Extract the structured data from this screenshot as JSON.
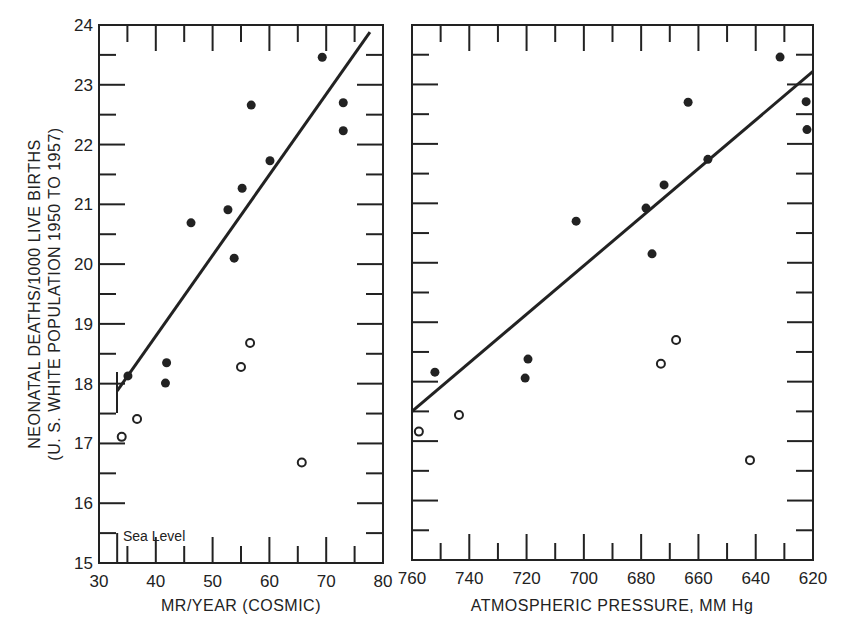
{
  "chart_data": [
    {
      "type": "scatter",
      "title": "",
      "xlabel": "MR/YEAR (COSMIC)",
      "ylabel": "NEONATAL DEATHS/1000 LIVE BIRTHS",
      "ylabel2": "(U. S. WHITE POPULATION 1950 TO 1957)",
      "xlim": [
        30,
        80
      ],
      "ylim": [
        15,
        24
      ],
      "xticks": [
        30,
        40,
        50,
        60,
        70,
        80
      ],
      "yticks": [
        15,
        16,
        17,
        18,
        19,
        20,
        21,
        22,
        23,
        24
      ],
      "grid": false,
      "annotations": [
        {
          "text": "Sea Level",
          "x": 34,
          "y": 15.4
        }
      ],
      "series": [
        {
          "name": "filled",
          "marker": "filled-circle",
          "points": [
            [
              69.3,
              23.46
            ],
            [
              56.8,
              22.66
            ],
            [
              73.0,
              22.7
            ],
            [
              73.0,
              22.23
            ],
            [
              60.1,
              21.73
            ],
            [
              55.2,
              21.27
            ],
            [
              52.7,
              20.91
            ],
            [
              46.2,
              20.69
            ],
            [
              53.8,
              20.1
            ],
            [
              35.1,
              18.13
            ],
            [
              41.9,
              18.35
            ],
            [
              41.7,
              18.01
            ]
          ]
        },
        {
          "name": "open",
          "marker": "open-circle",
          "points": [
            [
              34.0,
              17.11
            ],
            [
              36.7,
              17.41
            ],
            [
              55.0,
              18.28
            ],
            [
              56.6,
              18.68
            ],
            [
              65.7,
              16.68
            ]
          ]
        },
        {
          "name": "regression line",
          "type": "line",
          "points": [
            [
              33.2,
              17.88
            ],
            [
              77.7,
              23.88
            ]
          ]
        }
      ]
    },
    {
      "type": "scatter",
      "title": "",
      "xlabel": "ATMOSPHERIC PRESSURE, MM Hg",
      "ylabel": "",
      "xlim": [
        760,
        620
      ],
      "ylim": [
        15,
        24
      ],
      "xticks": [
        760,
        740,
        720,
        700,
        680,
        660,
        640,
        620
      ],
      "grid": false,
      "series": [
        {
          "name": "filled",
          "marker": "filled-circle",
          "points": [
            [
              631.5,
              23.46
            ],
            [
              622.4,
              22.71
            ],
            [
              622.1,
              22.24
            ],
            [
              663.6,
              22.7
            ],
            [
              656.7,
              21.74
            ],
            [
              672.0,
              21.31
            ],
            [
              678.3,
              20.92
            ],
            [
              702.7,
              20.7
            ],
            [
              676.2,
              20.15
            ],
            [
              752.0,
              18.16
            ],
            [
              719.5,
              18.38
            ],
            [
              720.5,
              18.06
            ]
          ]
        },
        {
          "name": "open",
          "marker": "open-circle",
          "points": [
            [
              757.6,
              17.16
            ],
            [
              743.6,
              17.44
            ],
            [
              673.1,
              18.3
            ],
            [
              667.8,
              18.7
            ],
            [
              642.0,
              16.68
            ]
          ]
        },
        {
          "name": "regression line",
          "type": "line",
          "points": [
            [
              760,
              17.5
            ],
            [
              620,
              23.22
            ]
          ]
        }
      ]
    }
  ],
  "labels": {
    "left_xlabel": "MR/YEAR (COSMIC)",
    "right_xlabel": "ATMOSPHERIC PRESSURE, MM Hg",
    "ylabel_line1": "NEONATAL DEATHS/1000 LIVE BIRTHS",
    "ylabel_line2": "(U. S. WHITE POPULATION 1950 TO 1957)",
    "sea_level": "Sea Level"
  },
  "colors": {
    "ink": "#222222",
    "background": "#ffffff"
  }
}
